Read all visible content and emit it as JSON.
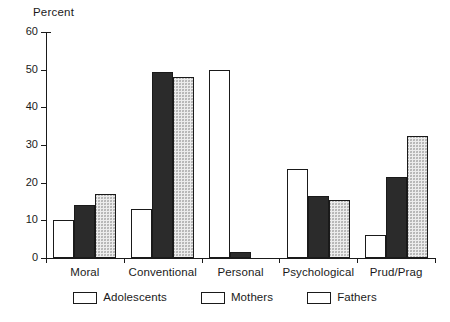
{
  "chart_data": {
    "type": "bar",
    "title": "",
    "subtitle": "",
    "xlabel": "",
    "ylabel": "Percent",
    "ylim": [
      0,
      60
    ],
    "yticks": [
      0,
      10,
      20,
      30,
      40,
      50,
      60
    ],
    "grid": false,
    "legend_position": "bottom",
    "categories": [
      "Moral",
      "Conventional",
      "Personal",
      "Psychological",
      "Prud/Prag"
    ],
    "series": [
      {
        "name": "Adolescents",
        "fill": "white",
        "values": [
          10,
          13,
          50,
          23.5,
          6
        ]
      },
      {
        "name": "Mothers",
        "fill": "dark-crosshatch",
        "values": [
          14,
          49.5,
          1.5,
          16.5,
          21.5
        ]
      },
      {
        "name": "Fathers",
        "fill": "light-stipple",
        "values": [
          17,
          48,
          0,
          15.5,
          32.5
        ]
      }
    ]
  },
  "axis": {
    "y_title": "Percent",
    "tick_labels": [
      "60",
      "50",
      "40",
      "30",
      "20",
      "10",
      "0"
    ]
  },
  "legend": {
    "entries": [
      {
        "label": "Adolescents",
        "swatch": "white-swatch"
      },
      {
        "label": "Mothers",
        "swatch": "dark-crosshatch-swatch"
      },
      {
        "label": "Fathers",
        "swatch": "light-stipple-swatch"
      }
    ]
  },
  "colors": {
    "axis": "#1a1a1a",
    "text": "#1a1a1a",
    "background": "#ffffff",
    "adolescents_fill": "#ffffff",
    "mothers_fill": "#2b2b2b",
    "fathers_fill": "#ececec"
  }
}
